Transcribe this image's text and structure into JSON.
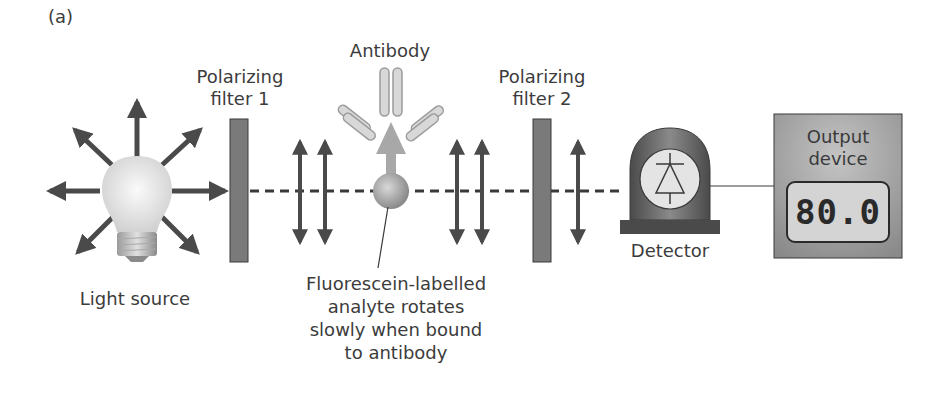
{
  "figure": {
    "panel_label": "(a)"
  },
  "components": {
    "light_source": {
      "label": "Light source"
    },
    "filter1": {
      "label_line1": "Polarizing",
      "label_line2": "filter 1"
    },
    "antibody": {
      "label": "Antibody"
    },
    "analyte": {
      "label_line1": "Fluorescein-labelled",
      "label_line2": "analyte rotates",
      "label_line3": "slowly when bound",
      "label_line4": "to antibody"
    },
    "filter2": {
      "label_line1": "Polarizing",
      "label_line2": "filter 2"
    },
    "detector": {
      "label": "Detector"
    },
    "output_device": {
      "label_line1": "Output",
      "label_line2": "device",
      "reading": "80.0"
    }
  },
  "colors": {
    "arrow": "#4a4a4a",
    "filter": "#7a7a7a",
    "bulb": "#e8e8e8",
    "detector": "#5c5c5c",
    "output_box": "#8e8e8e",
    "display": "#d8d8d8"
  }
}
